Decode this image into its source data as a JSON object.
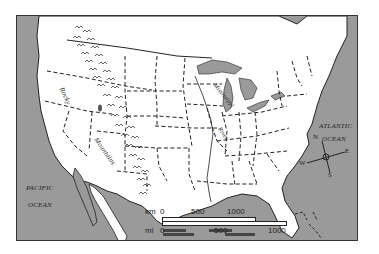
{
  "map": {
    "title": "United States physical features",
    "labels": {
      "pacific_1": "PACIFIC",
      "pacific_2": "OCEAN",
      "atlantic_1": "ATLANTIC",
      "atlantic_2": "OCEAN",
      "rocky": "Rocky",
      "mountains": "Mountains",
      "mississippi": "Mississippi",
      "river": "River"
    },
    "compass": {
      "n": "N",
      "s": "S",
      "e": "E",
      "w": "W",
      "icon": "compass-rose-icon"
    },
    "scale": {
      "km_label": "km",
      "km_ticks": [
        "0",
        "500",
        "1000"
      ],
      "mi_label": "mi",
      "mi_ticks": [
        "0",
        "500",
        "1000"
      ]
    },
    "colors": {
      "water": "#9a9a9a",
      "land": "#ffffff",
      "border": "#222222"
    }
  }
}
